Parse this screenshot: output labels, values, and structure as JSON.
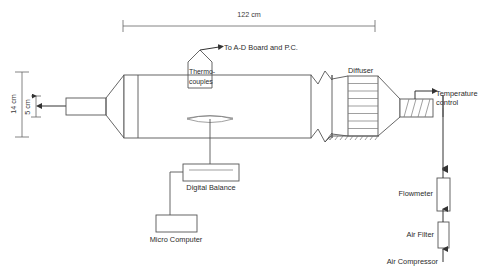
{
  "figure": {
    "background_color": "#ffffff",
    "line_color": "#555555",
    "text_color": "#2b2b2b"
  },
  "dimensions": {
    "length_label": "122 cm",
    "height_label": "14 cm",
    "inner_height_label": "5 cm"
  },
  "labels": {
    "ad_board": "To A-D Board and P.C.",
    "thermocouples_line1": "Thermo-",
    "thermocouples_line2": "couples",
    "diffuser": "Diffuser",
    "temperature_control_line1": "Temperature",
    "temperature_control_line2": "control",
    "digital_balance": "Digital Balance",
    "micro_computer": "Micro Computer",
    "flowmeter": "Flowmeter",
    "air_filter": "Air Filter",
    "air_compressor": "Air Compressor"
  }
}
